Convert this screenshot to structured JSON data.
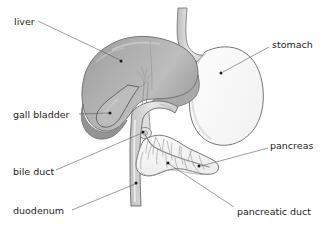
{
  "diagram": {
    "canvas": {
      "width": 333,
      "height": 238
    },
    "background_color": "#ffffff",
    "line_color": "#5a5a5a",
    "text_color": "#1c1c1c",
    "outline_color": "#6f6f6f",
    "fill_liver_dark": "#9e9e9e",
    "fill_liver_mid": "#b4b4b4",
    "fill_liver_light": "#c9c9c9",
    "fill_stomach": "#fcfcfc",
    "fill_duct": "#dcdcdc",
    "fill_pancreas": "#fbfbfb",
    "labels": [
      {
        "id": "liver",
        "text": "liver",
        "text_x": 14,
        "text_y": 22,
        "anchor": "start",
        "leader_start_x": 38,
        "leader_start_y": 21,
        "leader_end_x": 120,
        "leader_end_y": 60,
        "dot_x": 121,
        "dot_y": 61
      },
      {
        "id": "stomach",
        "text": "stomach",
        "text_x": 272,
        "text_y": 45,
        "anchor": "start",
        "leader_start_x": 269,
        "leader_start_y": 47,
        "leader_end_x": 223,
        "leader_end_y": 72,
        "dot_x": 221,
        "dot_y": 73
      },
      {
        "id": "gall-bladder",
        "text": "gall bladder",
        "text_x": 13,
        "text_y": 115,
        "anchor": "start",
        "leader_start_x": 79,
        "leader_start_y": 114,
        "leader_end_x": 110,
        "leader_end_y": 113,
        "dot_x": 110,
        "dot_y": 113
      },
      {
        "id": "bile-duct",
        "text": "bile duct",
        "text_x": 13,
        "text_y": 172,
        "anchor": "start",
        "leader_start_x": 56,
        "leader_start_y": 170,
        "leader_end_x": 142,
        "leader_end_y": 133,
        "dot_x": 143,
        "dot_y": 132
      },
      {
        "id": "duodenum",
        "text": "duodenum",
        "text_x": 13,
        "text_y": 211,
        "anchor": "start",
        "leader_start_x": 72,
        "leader_start_y": 210,
        "leader_end_x": 135,
        "leader_end_y": 184,
        "dot_x": 136,
        "dot_y": 183
      },
      {
        "id": "pancreas",
        "text": "pancreas",
        "text_x": 270,
        "text_y": 146,
        "anchor": "start",
        "leader_start_x": 268,
        "leader_start_y": 148,
        "leader_end_x": 201,
        "leader_end_y": 166,
        "dot_x": 199,
        "dot_y": 166
      },
      {
        "id": "pancreatic-duct",
        "text": "pancreatic duct",
        "text_x": 237,
        "text_y": 212,
        "anchor": "start",
        "leader_start_x": 234,
        "leader_start_y": 207,
        "leader_end_x": 169,
        "leader_end_y": 164,
        "dot_x": 168,
        "dot_y": 163
      }
    ],
    "organs": [
      {
        "id": "liver",
        "name": "liver"
      },
      {
        "id": "stomach",
        "name": "stomach"
      },
      {
        "id": "gall-bladder",
        "name": "gall bladder"
      },
      {
        "id": "bile-duct",
        "name": "bile duct"
      },
      {
        "id": "duodenum",
        "name": "duodenum"
      },
      {
        "id": "pancreas",
        "name": "pancreas"
      },
      {
        "id": "pancreatic-duct",
        "name": "pancreatic duct"
      },
      {
        "id": "esophagus",
        "name": "esophagus"
      }
    ]
  }
}
